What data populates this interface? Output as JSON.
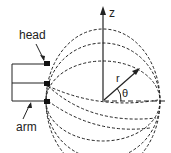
{
  "diagram": {
    "labels": {
      "head": "head",
      "arm": "arm",
      "z_axis": "z",
      "radius": "r",
      "angle": "θ"
    },
    "colors": {
      "stroke": "#222222",
      "background": "#ffffff"
    },
    "elements": [
      "probe-arms (3)",
      "probe-heads (3)",
      "dashed field-line ellipses (3 nested)",
      "z-axis arrow",
      "horizontal dashed axis",
      "radius vector r",
      "angle arc θ"
    ]
  }
}
